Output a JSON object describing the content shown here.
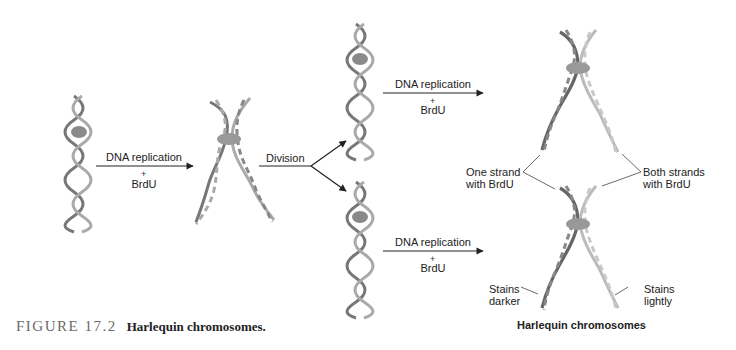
{
  "figure": {
    "number_label": "FIGURE 17.2",
    "caption": "Harlequin chromosomes."
  },
  "steps": {
    "step1": {
      "label": "DNA replication",
      "plus": "+",
      "agent": "BrdU"
    },
    "step2": {
      "label": "Division"
    },
    "step3_top": {
      "label": "DNA replication",
      "plus": "+",
      "agent": "BrdU"
    },
    "step3_bottom": {
      "label": "DNA replication",
      "plus": "+",
      "agent": "BrdU"
    }
  },
  "annotations": {
    "one_strand": [
      "One strand",
      "with BrdU"
    ],
    "both_strands": [
      "Both strands",
      "with BrdU"
    ],
    "stains_darker": [
      "Stains",
      "darker"
    ],
    "stains_lightly": [
      "Stains",
      "lightly"
    ]
  },
  "result_title": "Harlequin chromosomes",
  "colors": {
    "helix_dark": "#6e6e6e",
    "helix_light": "#b5b5b5",
    "centromere": "#8a8a8a",
    "arrow": "#222222",
    "caption_number": "#6a6a6a"
  },
  "icons": {
    "helix": "double-helix-dna",
    "centromere": "centromere-oval",
    "arrow": "right-arrow"
  }
}
